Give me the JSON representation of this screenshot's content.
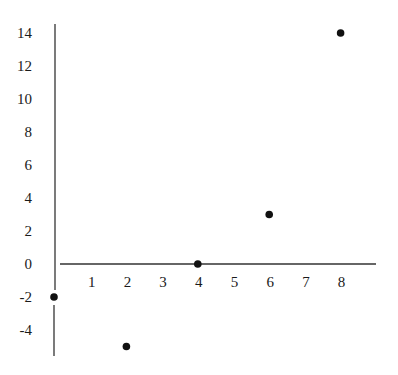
{
  "chart_data": {
    "type": "scatter",
    "title": "",
    "xlabel": "",
    "ylabel": "",
    "x_ticks": [
      "1",
      "2",
      "3",
      "4",
      "5",
      "6",
      "7",
      "8"
    ],
    "y_ticks": [
      "14",
      "12",
      "10",
      "8",
      "6",
      "4",
      "2",
      "0",
      "-2",
      "-4"
    ],
    "xlim": [
      0,
      9
    ],
    "ylim": [
      -5.5,
      15
    ],
    "grid": false,
    "legend": null,
    "series": [
      {
        "name": "points",
        "x": [
          0,
          2,
          4,
          6,
          8
        ],
        "y": [
          -2,
          -5,
          0,
          3,
          14
        ]
      }
    ]
  }
}
